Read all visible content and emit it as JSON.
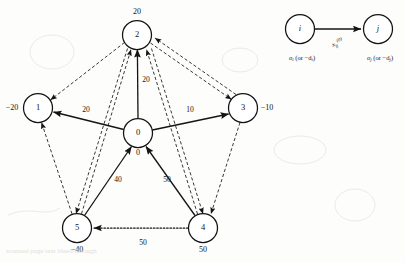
{
  "figure": {
    "ink_color": "#141414",
    "background": "#fdfdfc"
  },
  "nodes": [
    {
      "id": "0",
      "cx": 138,
      "cy": 133,
      "r": 14.5,
      "supply": "0",
      "supply_x": 138,
      "supply_y": 153
    },
    {
      "id": "1",
      "cx": 38,
      "cy": 108,
      "r": 14.5,
      "supply": "−20",
      "supply_x": 12,
      "supply_y": 108
    },
    {
      "id": "2",
      "cx": 137,
      "cy": 35,
      "r": 14.5,
      "supply": "20",
      "supply_x": 137,
      "supply_y": 12
    },
    {
      "id": "3",
      "cx": 243,
      "cy": 108,
      "r": 14.5,
      "supply": "−10",
      "supply_x": 267,
      "supply_y": 108
    },
    {
      "id": "4",
      "cx": 203,
      "cy": 228,
      "r": 14.5,
      "supply": "50",
      "supply_x": 203,
      "supply_y": 250
    },
    {
      "id": "5",
      "cx": 77,
      "cy": 228,
      "r": 14.5,
      "supply": "−40",
      "supply_x": 77,
      "supply_y": 250
    }
  ],
  "arcs": [
    {
      "name": "arc-0-to-1",
      "style": "solid",
      "label": "20",
      "label_x": 86,
      "label_y": 110
    },
    {
      "name": "arc-0-to-2",
      "style": "solid",
      "label": "20",
      "label_x": 146,
      "label_y": 80
    },
    {
      "name": "arc-0-to-3",
      "style": "solid",
      "label": "10",
      "label_x": 190,
      "label_y": 110
    },
    {
      "name": "arc-5-to-0",
      "style": "solid",
      "label": "40",
      "label_x": 118,
      "label_y": 180
    },
    {
      "name": "arc-4-to-0",
      "style": "solid",
      "label": "50",
      "label_x": 167,
      "label_y": 180
    },
    {
      "name": "arc-4-to-5",
      "style": "dotted",
      "label": "50",
      "label_x": 143,
      "label_y": 243
    },
    {
      "name": "arc-2-to-1",
      "style": "dashed",
      "label": "",
      "label_x": 0,
      "label_y": 0
    },
    {
      "name": "arc-2-to-3",
      "style": "dashed",
      "label": "",
      "label_x": 0,
      "label_y": 0
    },
    {
      "name": "arc-2-to-5",
      "style": "dashed",
      "label": "",
      "label_x": 0,
      "label_y": 0
    },
    {
      "name": "arc-5-to-2",
      "style": "dashed",
      "label": "",
      "label_x": 0,
      "label_y": 0
    },
    {
      "name": "arc-2-to-4",
      "style": "dashed",
      "label": "",
      "label_x": 0,
      "label_y": 0
    },
    {
      "name": "arc-4-to-2",
      "style": "dashed",
      "label": "",
      "label_x": 0,
      "label_y": 0
    },
    {
      "name": "arc-3-to-4",
      "style": "dashed",
      "label": "",
      "label_x": 0,
      "label_y": 0
    },
    {
      "name": "arc-5-to-1",
      "style": "dashed",
      "label": "",
      "label_x": 0,
      "label_y": 0
    },
    {
      "name": "arc-3-to-2",
      "style": "dashed",
      "label": "",
      "label_x": 0,
      "label_y": 0
    }
  ],
  "legend": {
    "node_i": {
      "id": "i",
      "cx": 300,
      "cy": 29,
      "r": 14.5
    },
    "node_j": {
      "id": "j",
      "cx": 378,
      "cy": 29,
      "r": 14.5
    },
    "arc_label": "x",
    "arc_label_sub": "ij",
    "arc_label_sup": "(0)",
    "label_i_prefix": "o",
    "label_i_sub": "i",
    "label_i_mid": " (or −d",
    "label_i_sub2": "i",
    "label_i_suffix": ")",
    "label_j_prefix": "o",
    "label_j_sub": "j",
    "label_j_mid": " (or −d",
    "label_j_sub2": "j",
    "label_j_suffix": ")"
  },
  "bleed": {
    "bottom_line": "scanned page text bleed-through"
  }
}
